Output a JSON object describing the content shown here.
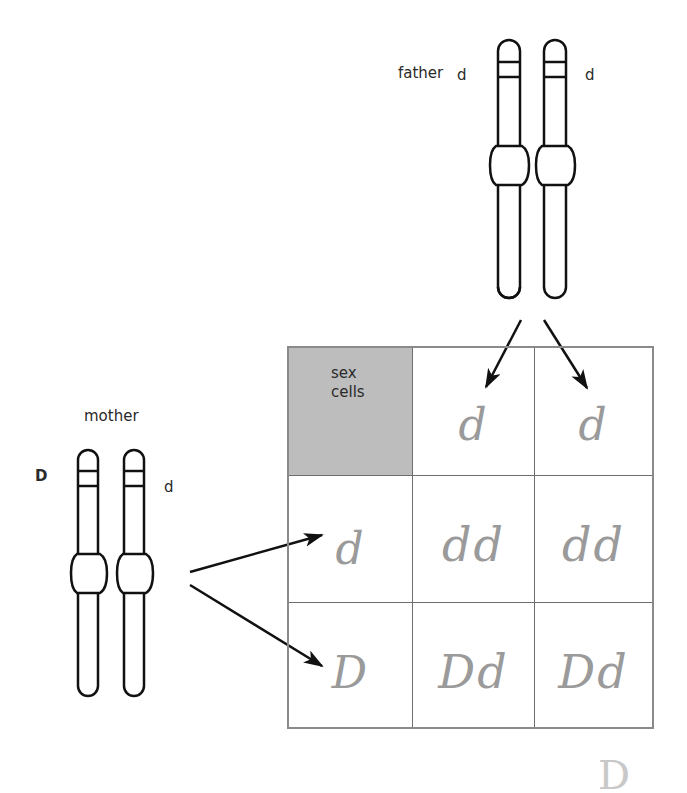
{
  "father": {
    "label": "father",
    "allele_left": "d",
    "allele_right": "d"
  },
  "mother": {
    "label": "mother",
    "allele_left": "D",
    "allele_right": "d"
  },
  "punnett": {
    "corner_label_line1": "sex",
    "corner_label_line2": "cells",
    "column_headers": [
      "d",
      "d"
    ],
    "row_headers": [
      "d",
      "D"
    ],
    "cells": [
      [
        "dd",
        "dd"
      ],
      [
        "Dd",
        "Dd"
      ]
    ]
  },
  "stray_mark": "D",
  "colors": {
    "corner_fill": "#bdbdbd",
    "grid_line": "#6e6e6e",
    "handwriting": "#9a9a9a",
    "outline": "#111111"
  }
}
